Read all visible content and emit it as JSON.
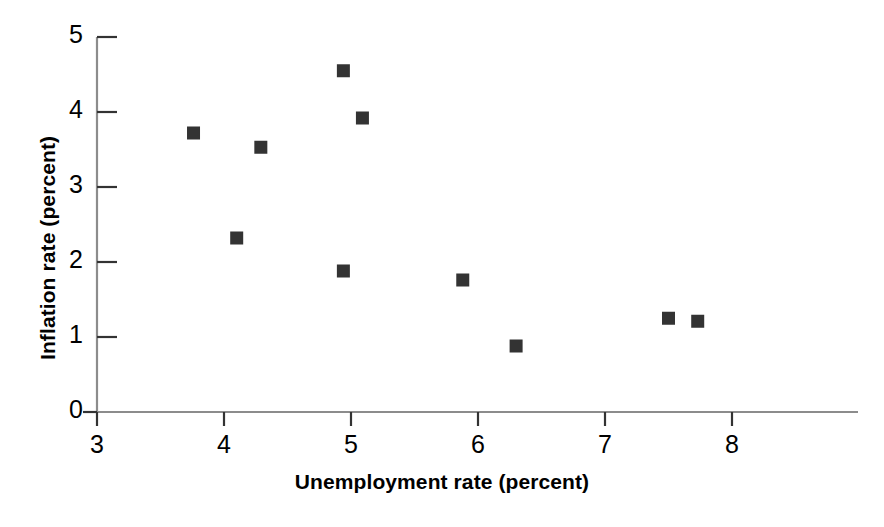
{
  "chart_data": {
    "type": "scatter",
    "title": "",
    "xlabel": "Unemployment rate (percent)",
    "ylabel": "Inflation rate (percent)",
    "xlim": [
      3,
      8.7
    ],
    "ylim": [
      0,
      5
    ],
    "xticks": [
      "3",
      "4",
      "5",
      "6",
      "7",
      "8"
    ],
    "xtick_values": [
      3,
      4,
      5,
      6,
      7,
      8
    ],
    "yticks": [
      "0",
      "1",
      "2",
      "3",
      "4",
      "5"
    ],
    "ytick_values": [
      0,
      1,
      2,
      3,
      4,
      5
    ],
    "grid": false,
    "legend": null,
    "marker": "square",
    "marker_color": "#333333",
    "axis_color": "#8c8c8c",
    "points": [
      {
        "x": 3.76,
        "y": 3.72
      },
      {
        "x": 4.1,
        "y": 2.32
      },
      {
        "x": 4.29,
        "y": 3.53
      },
      {
        "x": 4.94,
        "y": 4.55
      },
      {
        "x": 4.94,
        "y": 1.88
      },
      {
        "x": 5.09,
        "y": 3.92
      },
      {
        "x": 5.88,
        "y": 1.76
      },
      {
        "x": 6.3,
        "y": 0.88
      },
      {
        "x": 7.5,
        "y": 1.25
      },
      {
        "x": 7.73,
        "y": 1.21
      }
    ]
  }
}
